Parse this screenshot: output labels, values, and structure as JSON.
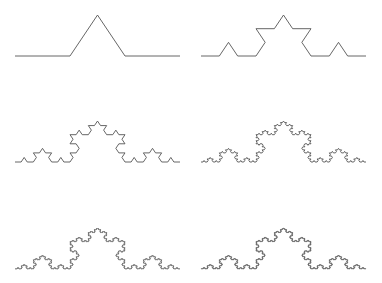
{
  "figure": {
    "width": 382,
    "height": 283,
    "background": "#ffffff",
    "stroke_color": "#555555",
    "stroke_width": 0.9,
    "y_scale": 0.86
  },
  "panels": [
    {
      "name": "koch-iteration-1",
      "iteration": 1,
      "x0": 15,
      "x1": 180,
      "baseline_y": 56
    },
    {
      "name": "koch-iteration-2",
      "iteration": 2,
      "x0": 201,
      "x1": 366,
      "baseline_y": 56
    },
    {
      "name": "koch-iteration-3",
      "iteration": 3,
      "x0": 15,
      "x1": 180,
      "baseline_y": 162
    },
    {
      "name": "koch-iteration-4",
      "iteration": 4,
      "x0": 201,
      "x1": 366,
      "baseline_y": 162
    },
    {
      "name": "koch-iteration-5",
      "iteration": 5,
      "x0": 15,
      "x1": 180,
      "baseline_y": 269
    },
    {
      "name": "koch-iteration-6",
      "iteration": 6,
      "x0": 201,
      "x1": 366,
      "baseline_y": 269
    }
  ]
}
